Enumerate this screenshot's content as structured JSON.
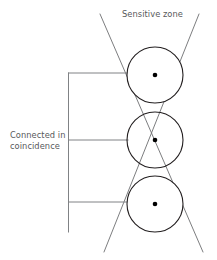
{
  "figure": {
    "type": "schematic-diagram",
    "background_color": "#ffffff",
    "width": 217,
    "height": 260
  },
  "labels": {
    "sensitive_zone": "Sensitive zone",
    "connected_in_coincidence": "Connected in\ncoincidence"
  },
  "style": {
    "detector_outline_color": "#231f20",
    "detector_fill_color": "#ffffff",
    "detector_center_dot_color": "#000000",
    "cone_line_color": "#6d6e71",
    "wire_line_color": "#808285",
    "text_color": "#58595b",
    "detector_stroke_width": 1.1,
    "cone_stroke_width": 0.9,
    "wire_stroke_width": 1.0
  },
  "detectors": [
    {
      "id": "detector-top",
      "cx": 155,
      "cy": 75,
      "r": 28,
      "dot_r": 2.3
    },
    {
      "id": "detector-middle",
      "cx": 155,
      "cy": 140,
      "r": 28,
      "dot_r": 2.3
    },
    {
      "id": "detector-bottom",
      "cx": 155,
      "cy": 204,
      "r": 28,
      "dot_r": 2.3
    }
  ],
  "cone_lines": [
    {
      "id": "cone-line-left-to-right",
      "x1": 100,
      "y1": 14,
      "x2": 203,
      "y2": 252
    },
    {
      "id": "cone-line-right-to-left",
      "x1": 199,
      "y1": 14,
      "x2": 104,
      "y2": 252
    }
  ],
  "wiring": {
    "bus": {
      "id": "coincidence-bus",
      "x": 68.5,
      "y1": 73,
      "y2": 232
    },
    "branches": [
      {
        "id": "branch-top",
        "y": 73,
        "x1": 68.5,
        "x2": 133
      },
      {
        "id": "branch-middle",
        "y": 140,
        "x1": 68.5,
        "x2": 128
      },
      {
        "id": "branch-bottom",
        "y": 202,
        "x1": 68.5,
        "x2": 133
      }
    ]
  }
}
